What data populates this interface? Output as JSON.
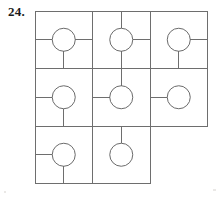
{
  "figure": {
    "number_label": "24.",
    "title": "",
    "type": "grid-of-cells-with-circles-and-connector-stubs",
    "stroke_color": "#6e6e6e",
    "circle_stroke_color": "#6b6b6b",
    "number_color": "#1b1b1b",
    "background_color": "#ffffff",
    "stroke_width": 1,
    "geometry": {
      "grid_origin_x": 35,
      "grid_origin_y": 11,
      "cell_width": 57.5,
      "cell_height": 57.5,
      "columns": 3,
      "rows": 3,
      "circle_radius": 11.5,
      "outer_border_x": [
        35,
        92.5,
        150,
        207.5
      ],
      "outer_border_y": [
        11,
        68.5,
        126,
        183.5
      ]
    },
    "cells": [
      {
        "name": "cell-r1c1",
        "row": 1,
        "col": 1,
        "circle": true,
        "connectors": [
          "left",
          "right",
          "down"
        ]
      },
      {
        "name": "cell-r1c2",
        "row": 1,
        "col": 2,
        "circle": true,
        "connectors": [
          "up",
          "right",
          "down"
        ]
      },
      {
        "name": "cell-r1c3",
        "row": 1,
        "col": 3,
        "circle": true,
        "connectors": [
          "right",
          "down"
        ]
      },
      {
        "name": "cell-r2c1",
        "row": 2,
        "col": 1,
        "circle": true,
        "connectors": [
          "left",
          "down"
        ]
      },
      {
        "name": "cell-r2c2",
        "row": 2,
        "col": 2,
        "circle": true,
        "connectors": [
          "up",
          "left"
        ]
      },
      {
        "name": "cell-r2c3",
        "row": 2,
        "col": 3,
        "circle": true,
        "connectors": [
          "left"
        ]
      },
      {
        "name": "cell-r3c1",
        "row": 3,
        "col": 1,
        "circle": true,
        "connectors": [
          "left",
          "down"
        ]
      },
      {
        "name": "cell-r3c2",
        "row": 3,
        "col": 2,
        "circle": true,
        "connectors": [
          "up"
        ]
      }
    ],
    "outline_segments": [
      {
        "name": "top-edge",
        "x1": 35,
        "y1": 11,
        "x2": 207.5,
        "y2": 11
      },
      {
        "name": "row1-row2-divider",
        "x1": 35,
        "y1": 68.5,
        "x2": 207.5,
        "y2": 68.5
      },
      {
        "name": "row2-row3-divider",
        "x1": 35,
        "y1": 126,
        "x2": 207.5,
        "y2": 126
      },
      {
        "name": "bottom-edge",
        "x1": 35,
        "y1": 183.5,
        "x2": 150,
        "y2": 183.5
      },
      {
        "name": "left-edge",
        "x1": 35,
        "y1": 11,
        "x2": 35,
        "y2": 183.5
      },
      {
        "name": "col1-col2-divider",
        "x1": 92.5,
        "y1": 11,
        "x2": 92.5,
        "y2": 183.5
      },
      {
        "name": "col2-col3-divider",
        "x1": 150,
        "y1": 11,
        "x2": 150,
        "y2": 183.5
      },
      {
        "name": "right-edge",
        "x1": 207.5,
        "y1": 11,
        "x2": 207.5,
        "y2": 126
      }
    ]
  }
}
